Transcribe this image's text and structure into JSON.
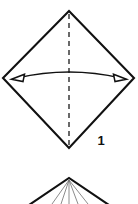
{
  "figure": {
    "background_color": "#ffffff",
    "line_color": "#111111",
    "thin_line_color": "#6f6f6f",
    "width": 138,
    "height": 204
  },
  "step1": {
    "label": "1",
    "shape_name": "diamond",
    "shape_description": "square rotated 45 degrees",
    "vertices": {
      "top": [
        69,
        11
      ],
      "right": [
        134,
        78
      ],
      "bottom": [
        69,
        148
      ],
      "left": [
        3,
        78
      ]
    },
    "fold_line": {
      "style": "dashed",
      "orientation": "vertical",
      "from": [
        69,
        14
      ],
      "to": [
        69,
        145
      ],
      "dash_pattern": "5 4",
      "color": "#111111"
    },
    "arrow": {
      "name": "double-headed-curved-arrow",
      "heads": 2,
      "head_style": "hollow",
      "direction": "left-and-right",
      "left_tip": [
        12,
        79
      ],
      "right_tip": [
        126,
        79
      ],
      "arc_apex": [
        69,
        70
      ],
      "color": "#111111"
    }
  },
  "step2_preview": {
    "shape_name": "triangle-apex-with-creases",
    "apex": [
      69,
      178
    ],
    "left_edge_end": [
      29,
      204
    ],
    "right_edge_end": [
      109,
      204
    ],
    "crease_lines": [
      {
        "from": [
          69,
          179
        ],
        "to": [
          52,
          204
        ]
      },
      {
        "from": [
          69,
          179
        ],
        "to": [
          61,
          204
        ]
      },
      {
        "from": [
          69,
          179
        ],
        "to": [
          69,
          204
        ]
      },
      {
        "from": [
          69,
          179
        ],
        "to": [
          78,
          204
        ]
      },
      {
        "from": [
          69,
          179
        ],
        "to": [
          88,
          204
        ]
      }
    ],
    "cropped": "true"
  }
}
